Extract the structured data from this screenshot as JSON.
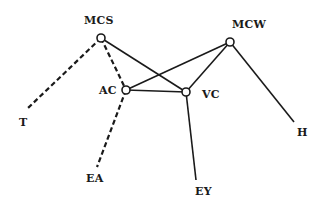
{
  "nodes": [
    {
      "id": "MCS",
      "label": "MCS",
      "x": 101,
      "y": 38,
      "circle": true,
      "lx": 84,
      "ly": 14
    },
    {
      "id": "AC",
      "label": "AC",
      "x": 126,
      "y": 90,
      "circle": true,
      "lx": 99,
      "ly": 84
    },
    {
      "id": "VC",
      "label": "VC",
      "x": 186,
      "y": 92,
      "circle": true,
      "lx": 202,
      "ly": 88
    },
    {
      "id": "MCW",
      "label": "MCW",
      "x": 230,
      "y": 42,
      "circle": true,
      "lx": 232,
      "ly": 18
    },
    {
      "id": "T",
      "label": "T",
      "x": 28,
      "y": 108,
      "circle": false,
      "lx": 19,
      "ly": 116
    },
    {
      "id": "EA",
      "label": "EA",
      "x": 97,
      "y": 167,
      "circle": false,
      "lx": 86,
      "ly": 172
    },
    {
      "id": "EY",
      "label": "EY",
      "x": 196,
      "y": 180,
      "circle": false,
      "lx": 195,
      "ly": 185
    },
    {
      "id": "H",
      "label": "H",
      "x": 294,
      "y": 122,
      "circle": false,
      "lx": 297,
      "ly": 126
    }
  ],
  "edges": [
    {
      "from": "MCS",
      "to": "T",
      "style": "dashed"
    },
    {
      "from": "MCS",
      "to": "AC",
      "style": "dashed"
    },
    {
      "from": "AC",
      "to": "EA",
      "style": "dashed"
    },
    {
      "from": "MCS",
      "to": "VC",
      "style": "solid"
    },
    {
      "from": "AC",
      "to": "VC",
      "style": "solid"
    },
    {
      "from": "AC",
      "to": "MCW",
      "style": "solid"
    },
    {
      "from": "VC",
      "to": "MCW",
      "style": "solid"
    },
    {
      "from": "VC",
      "to": "EY",
      "style": "solid"
    },
    {
      "from": "MCW",
      "to": "H",
      "style": "solid"
    }
  ],
  "colors": {
    "line": "#1a1a1a",
    "background": "#ffffff"
  }
}
